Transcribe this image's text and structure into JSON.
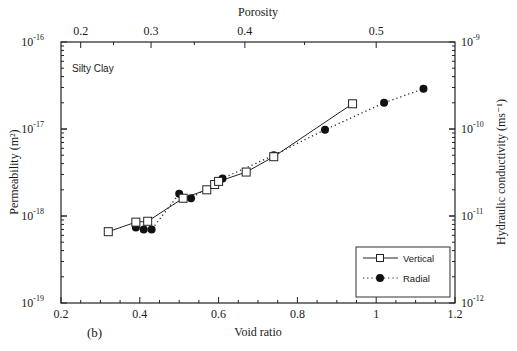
{
  "panel_label": "(b)",
  "annotation": "Silty Clay",
  "chart_data": {
    "type": "scatter",
    "title": "",
    "annotation": "Silty Clay",
    "panel_label": "(b)",
    "xlabel": "Void ratio",
    "x2label": "Porosity",
    "ylabel": "Permeability (m²)",
    "y2label": "Hydraulic conductivity (ms⁻¹)",
    "xlim": [
      0.2,
      1.2
    ],
    "ylim": [
      1e-19,
      1e-16
    ],
    "yscale": "log",
    "y2lim": [
      1e-12,
      1e-09
    ],
    "x_ticks": [
      "0.2",
      "0.4",
      "0.6",
      "0.8",
      "1",
      "1.2"
    ],
    "x2_ticks": [
      "0.2",
      "0.3",
      "0.4",
      "0.5"
    ],
    "y_ticks": [
      "10^-19",
      "10^-18",
      "10^-17",
      "10^-16"
    ],
    "y2_ticks": [
      "10^-12",
      "10^-11",
      "10^-10",
      "10^-9"
    ],
    "grid": false,
    "legend_position": "lower right",
    "series": [
      {
        "name": "Vertical",
        "marker": "open-square",
        "line": "solid",
        "x": [
          0.32,
          0.39,
          0.42,
          0.51,
          0.57,
          0.59,
          0.6,
          0.67,
          0.74,
          0.94
        ],
        "y": [
          6.6e-19,
          8.5e-19,
          8.7e-19,
          1.6e-18,
          2e-18,
          2.3e-18,
          2.5e-18,
          3.2e-18,
          4.8e-18,
          1.95e-17
        ]
      },
      {
        "name": "Radial",
        "marker": "filled-circle",
        "line": "dotted",
        "x": [
          0.39,
          0.41,
          0.43,
          0.5,
          0.53,
          0.61,
          0.74,
          0.87,
          1.02,
          1.12
        ],
        "y": [
          7.4e-19,
          7e-19,
          7e-19,
          1.8e-18,
          1.6e-18,
          2.7e-18,
          5e-18,
          9.8e-18,
          2e-17,
          2.9e-17
        ]
      }
    ]
  }
}
